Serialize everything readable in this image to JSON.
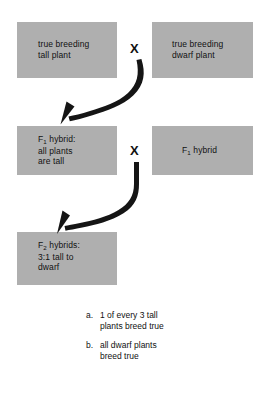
{
  "diagram": {
    "box_fill_color": "#afafaf",
    "text_color": "#111111",
    "background_color": "#ffffff",
    "cross_symbol": "X",
    "boxes": [
      {
        "id": "parent-tall",
        "label": "true breeding\ntall plant",
        "generation": "P"
      },
      {
        "id": "parent-dwarf",
        "label": "true breeding\ndwarf plant",
        "generation": "P"
      },
      {
        "id": "f1-left",
        "label_html": "F<sub>1</sub> hybrid:\nall plants\nare tall",
        "label": "F1 hybrid: all plants are tall",
        "generation": "F1"
      },
      {
        "id": "f1-right",
        "label_html": "F<sub>1</sub> hybrid",
        "label": "F1 hybrid",
        "generation": "F1"
      },
      {
        "id": "f2",
        "label_html": "F<sub>2</sub> hybrids:\n3:1 tall to\ndwarf",
        "label": "F2 hybrids: 3:1 tall to dwarf",
        "generation": "F2",
        "ratio": "3:1"
      }
    ],
    "crosses": [
      {
        "id": "cross-1",
        "symbol": "X",
        "between": [
          "parent-tall",
          "parent-dwarf"
        ]
      },
      {
        "id": "cross-2",
        "symbol": "X",
        "between": [
          "f1-left",
          "f1-right"
        ]
      }
    ],
    "arrows": [
      {
        "id": "arrow-p-to-f1",
        "from": "cross-1",
        "to": "f1-left"
      },
      {
        "id": "arrow-f1-to-f2",
        "from": "cross-2",
        "to": "f2"
      }
    ]
  },
  "notes": {
    "items": [
      {
        "marker": "a.",
        "text": "1 of every 3 tall\nplants breed true"
      },
      {
        "marker": "b.",
        "text": "all dwarf plants\nbreed true"
      }
    ]
  }
}
